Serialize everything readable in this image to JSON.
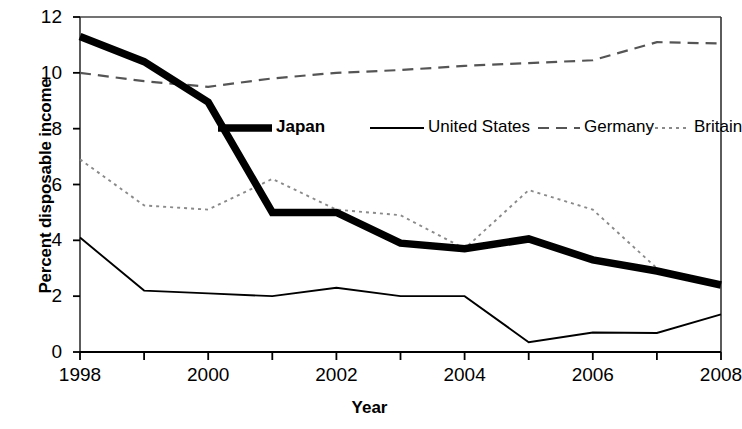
{
  "chart_data": {
    "type": "line",
    "title": "",
    "xlabel": "Year",
    "ylabel": "Percent disposable income",
    "x": [
      1998,
      1999,
      2000,
      2001,
      2002,
      2003,
      2004,
      2005,
      2006,
      2007,
      2008
    ],
    "xlim": [
      1998,
      2008
    ],
    "ylim": [
      0,
      12
    ],
    "yticks": [
      0,
      2,
      4,
      6,
      8,
      10,
      12
    ],
    "xticks_labeled": [
      1998,
      2000,
      2002,
      2004,
      2006,
      2008
    ],
    "xticks_minor": [
      1999,
      2001,
      2003,
      2005,
      2007
    ],
    "grid": false,
    "legend_position": "inside-upper-center",
    "series": [
      {
        "name": "Japan",
        "style": "thick-solid",
        "color": "#000000",
        "values": [
          11.3,
          10.4,
          8.95,
          5.0,
          5.0,
          3.9,
          3.7,
          4.05,
          3.3,
          2.9,
          2.4
        ]
      },
      {
        "name": "United States",
        "style": "thin-solid",
        "color": "#000000",
        "values": [
          4.1,
          2.2,
          2.1,
          2.0,
          2.3,
          2.0,
          2.0,
          0.35,
          0.7,
          0.68,
          1.35
        ]
      },
      {
        "name": "Germany",
        "style": "dashed",
        "color": "#555555",
        "values": [
          10.0,
          9.7,
          9.5,
          9.8,
          10.0,
          10.1,
          10.25,
          10.35,
          10.45,
          11.1,
          11.05
        ]
      },
      {
        "name": "Britain",
        "style": "dotted",
        "color": "#8a8a8a",
        "values": [
          6.9,
          5.25,
          5.1,
          6.2,
          5.1,
          4.9,
          3.7,
          5.8,
          5.1,
          3.0,
          2.4
        ]
      }
    ]
  },
  "axis": {
    "ylabel": "Percent disposable income",
    "xlabel": "Year",
    "ytick_labels": [
      "12",
      "10",
      "8",
      "6",
      "4",
      "2",
      "0"
    ],
    "xtick_labels": [
      "1998",
      "2000",
      "2002",
      "2004",
      "2006",
      "2008"
    ]
  },
  "legend": {
    "items": [
      {
        "label": "Japan",
        "style": "thick-solid"
      },
      {
        "label": "United States",
        "style": "thin-solid"
      },
      {
        "label": "Germany",
        "style": "dashed"
      },
      {
        "label": "Britain",
        "style": "dotted"
      }
    ]
  }
}
